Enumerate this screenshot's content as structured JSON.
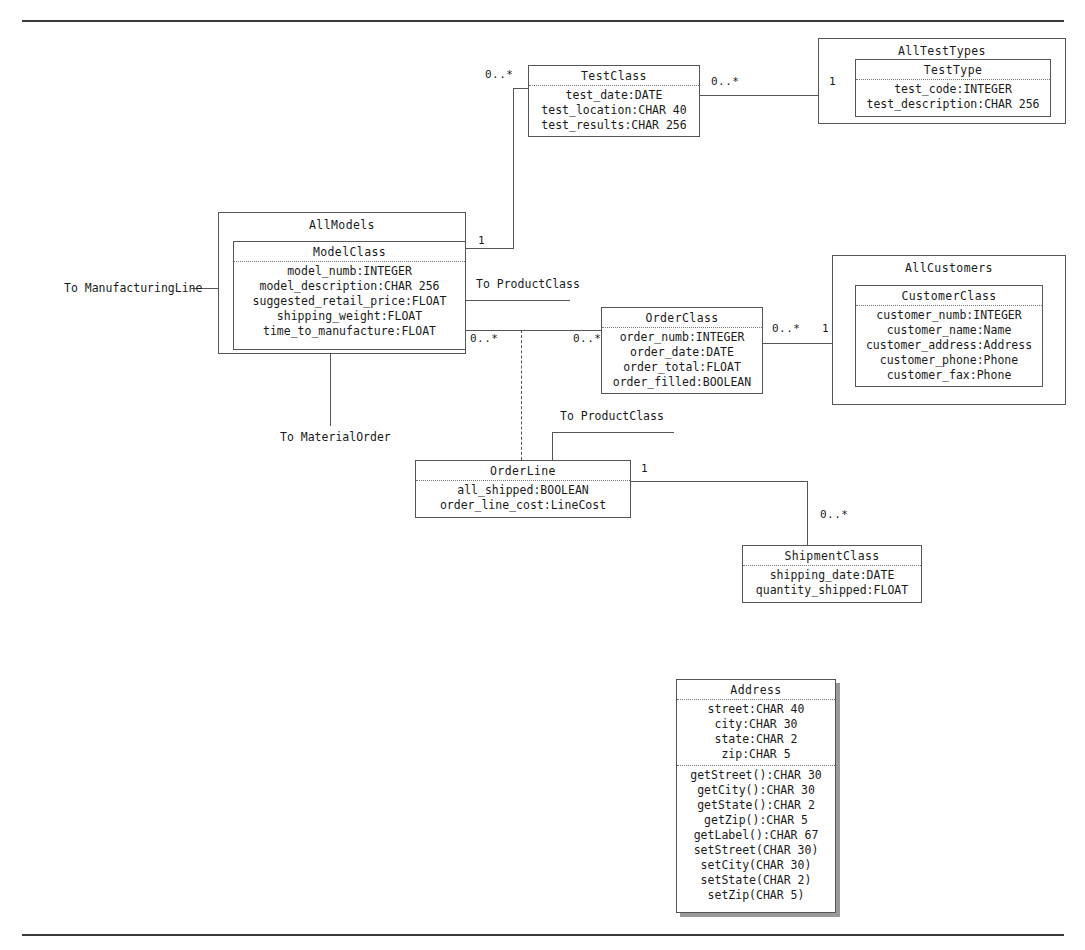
{
  "diagram": {
    "type": "uml-class-diagram",
    "stroke_color": "#555555",
    "text_color": "#1a1a1a",
    "background": "#ffffff"
  },
  "rules": {
    "top_label": "page-rule-top",
    "bottom_label": "page-rule-bottom"
  },
  "packages": [
    {
      "name": "AllTestTypes"
    },
    {
      "name": "AllModels"
    },
    {
      "name": "AllCustomers"
    }
  ],
  "classes": [
    {
      "name": "TestClass",
      "attributes": [
        "test_date:DATE",
        "test_location:CHAR 40",
        "test_results:CHAR 256"
      ],
      "methods": []
    },
    {
      "name": "TestType",
      "attributes": [
        "test_code:INTEGER",
        "test_description:CHAR 256"
      ],
      "methods": []
    },
    {
      "name": "ModelClass",
      "attributes": [
        "model_numb:INTEGER",
        "model_description:CHAR 256",
        "suggested_retail_price:FLOAT",
        "shipping_weight:FLOAT",
        "time_to_manufacture:FLOAT"
      ],
      "methods": []
    },
    {
      "name": "OrderClass",
      "attributes": [
        "order_numb:INTEGER",
        "order_date:DATE",
        "order_total:FLOAT",
        "order_filled:BOOLEAN"
      ],
      "methods": []
    },
    {
      "name": "CustomerClass",
      "attributes": [
        "customer_numb:INTEGER",
        "customer_name:Name",
        "customer_address:Address",
        "customer_phone:Phone",
        "customer_fax:Phone"
      ],
      "methods": []
    },
    {
      "name": "OrderLine",
      "attributes": [
        "all_shipped:BOOLEAN",
        "order_line_cost:LineCost"
      ],
      "methods": []
    },
    {
      "name": "ShipmentClass",
      "attributes": [
        "shipping_date:DATE",
        "quantity_shipped:FLOAT"
      ],
      "methods": []
    },
    {
      "name": "Address",
      "attributes": [
        "street:CHAR 40",
        "city:CHAR 30",
        "state:CHAR 2",
        "zip:CHAR 5"
      ],
      "methods": [
        "getStreet():CHAR 30",
        "getCity():CHAR 30",
        "getState():CHAR 2",
        "getZip():CHAR 5",
        "getLabel():CHAR 67",
        "setStreet(CHAR 30)",
        "setCity(CHAR 30)",
        "setState(CHAR 2)",
        "setZip(CHAR 5)"
      ]
    }
  ],
  "multiplicities": {
    "testclass_left": "0..*",
    "testclass_right": "0..*",
    "testtype_left": "1",
    "allmodels_right_top": "1",
    "modelclass_right_bottom": "0..*",
    "orderclass_left": "0..*",
    "orderclass_right": "0..*",
    "customerclass_left": "1",
    "orderline_right": "1",
    "shipmentclass_top": "0..*"
  },
  "notes": {
    "to_manufacturing_line": "To ManufacturingLine",
    "to_product_class_top": "To ProductClass",
    "to_material_order": "To MaterialOrder",
    "to_product_class_bottom": "To ProductClass"
  }
}
